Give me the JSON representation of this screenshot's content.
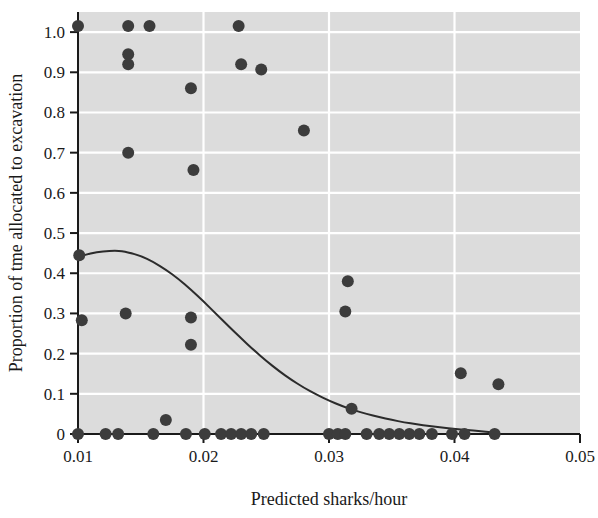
{
  "chart_data": {
    "type": "scatter",
    "title": "",
    "xlabel": "Predicted sharks/hour",
    "ylabel": "Proportion of tme allocated to excavation",
    "xlim": [
      0.01,
      0.05
    ],
    "ylim": [
      0.0,
      1.05
    ],
    "grid": true,
    "grid_color": "#ffffff",
    "plot_background": "#dcdcdc",
    "point_color": "#3c3c3c",
    "point_radius_px": 6,
    "line_color": "#2b2b2b",
    "legend": "none",
    "xticks": [
      0.01,
      0.02,
      0.03,
      0.04,
      0.05
    ],
    "xtick_labels": [
      "0.01",
      "0.02",
      "0.03",
      "0.04",
      "0.05"
    ],
    "yticks": [
      0,
      0.1,
      0.2,
      0.3,
      0.4,
      0.5,
      0.6,
      0.7,
      0.8,
      0.9,
      1.0
    ],
    "ytick_labels": [
      "0",
      "0.1",
      "0.2",
      "0.3",
      "0.4",
      "0.5",
      "0.6",
      "0.7",
      "0.8",
      "0.9",
      "1.0"
    ],
    "series": [
      {
        "name": "observations",
        "type": "scatter",
        "points": [
          [
            0.01,
            1.015
          ],
          [
            0.0101,
            0.445
          ],
          [
            0.0103,
            0.283
          ],
          [
            0.01,
            0.0
          ],
          [
            0.0122,
            0.0
          ],
          [
            0.0132,
            0.0
          ],
          [
            0.014,
            1.015
          ],
          [
            0.014,
            0.945
          ],
          [
            0.014,
            0.92
          ],
          [
            0.014,
            0.7
          ],
          [
            0.0138,
            0.3
          ],
          [
            0.0157,
            1.015
          ],
          [
            0.016,
            0.0
          ],
          [
            0.017,
            0.035
          ],
          [
            0.0186,
            0.0
          ],
          [
            0.019,
            0.86
          ],
          [
            0.0192,
            0.657
          ],
          [
            0.019,
            0.29
          ],
          [
            0.019,
            0.222
          ],
          [
            0.0201,
            0.0
          ],
          [
            0.0214,
            0.0
          ],
          [
            0.0222,
            0.0
          ],
          [
            0.0228,
            1.015
          ],
          [
            0.023,
            0.92
          ],
          [
            0.023,
            0.0
          ],
          [
            0.0238,
            0.0
          ],
          [
            0.0246,
            0.907
          ],
          [
            0.0248,
            0.0
          ],
          [
            0.028,
            0.755
          ],
          [
            0.03,
            0.0
          ],
          [
            0.0307,
            0.0
          ],
          [
            0.0313,
            0.0
          ],
          [
            0.0315,
            0.38
          ],
          [
            0.0313,
            0.305
          ],
          [
            0.0318,
            0.063
          ],
          [
            0.033,
            0.0
          ],
          [
            0.034,
            0.0
          ],
          [
            0.0348,
            0.0
          ],
          [
            0.0356,
            0.0
          ],
          [
            0.0364,
            0.0
          ],
          [
            0.0372,
            0.0
          ],
          [
            0.0382,
            0.0
          ],
          [
            0.0398,
            0.0
          ],
          [
            0.0405,
            0.151
          ],
          [
            0.0408,
            0.0
          ],
          [
            0.0435,
            0.124
          ],
          [
            0.0432,
            0.0
          ]
        ]
      },
      {
        "name": "fitted-curve",
        "type": "line",
        "points": [
          [
            0.01,
            0.44
          ],
          [
            0.011,
            0.45
          ],
          [
            0.012,
            0.455
          ],
          [
            0.013,
            0.456
          ],
          [
            0.0135,
            0.455
          ],
          [
            0.014,
            0.452
          ],
          [
            0.015,
            0.443
          ],
          [
            0.016,
            0.428
          ],
          [
            0.017,
            0.409
          ],
          [
            0.018,
            0.386
          ],
          [
            0.019,
            0.359
          ],
          [
            0.02,
            0.33
          ],
          [
            0.021,
            0.299
          ],
          [
            0.022,
            0.268
          ],
          [
            0.023,
            0.238
          ],
          [
            0.024,
            0.209
          ],
          [
            0.025,
            0.182
          ],
          [
            0.026,
            0.157
          ],
          [
            0.027,
            0.135
          ],
          [
            0.028,
            0.115
          ],
          [
            0.029,
            0.098
          ],
          [
            0.03,
            0.083
          ],
          [
            0.031,
            0.07
          ],
          [
            0.032,
            0.059
          ],
          [
            0.033,
            0.05
          ],
          [
            0.034,
            0.042
          ],
          [
            0.035,
            0.035
          ],
          [
            0.036,
            0.029
          ],
          [
            0.037,
            0.024
          ],
          [
            0.038,
            0.02
          ],
          [
            0.039,
            0.016
          ],
          [
            0.04,
            0.013
          ],
          [
            0.041,
            0.01
          ],
          [
            0.042,
            0.007
          ],
          [
            0.043,
            0.004
          ],
          [
            0.0435,
            0.003
          ]
        ]
      }
    ]
  }
}
